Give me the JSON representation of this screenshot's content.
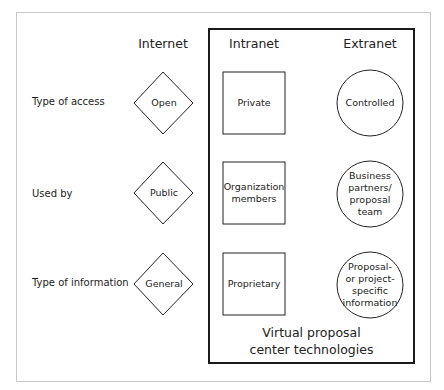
{
  "columns": [
    {
      "id": "internet",
      "label": "Internet",
      "shape": "diamond"
    },
    {
      "id": "intranet",
      "label": "Intranet",
      "shape": "square"
    },
    {
      "id": "extranet",
      "label": "Extranet",
      "shape": "circle"
    }
  ],
  "rows": [
    {
      "label": "Type of access",
      "internet": "Open",
      "intranet": "Private",
      "extranet": [
        "Controlled"
      ]
    },
    {
      "label": "Used by",
      "internet": "Public",
      "intranet": [
        "Organization",
        "members"
      ],
      "extranet": [
        "Business",
        "partners/",
        "proposal",
        "team"
      ]
    },
    {
      "label": "Type of information",
      "internet": "General",
      "intranet": "Proprietary",
      "extranet": [
        "Proposal-",
        "or project-",
        "specific",
        "information"
      ]
    }
  ],
  "caption": {
    "line1": "Virtual proposal",
    "line2": "center technologies"
  },
  "colors": {
    "frame": "#c8c8c8",
    "box": "#1a1a1a",
    "stroke": "#222222",
    "background": "#ffffff"
  }
}
